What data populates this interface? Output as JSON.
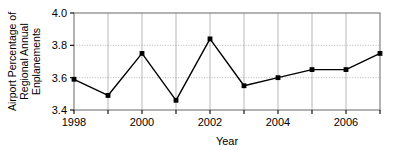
{
  "chart_data": {
    "type": "line",
    "title": "",
    "xlabel": "Year",
    "ylabel": "Airport Percentage of Regional Annual Enplanements",
    "ylabel_lines": [
      "Airport Percentage of",
      "Regional Annual",
      "Enplanements"
    ],
    "x": [
      1998,
      1999,
      2000,
      2001,
      2002,
      2003,
      2004,
      2005,
      2006,
      2007
    ],
    "values": [
      3.59,
      3.49,
      3.75,
      3.46,
      3.84,
      3.55,
      3.6,
      3.65,
      3.65,
      3.75
    ],
    "xlim": [
      1998,
      2007
    ],
    "ylim": [
      3.4,
      4.0
    ],
    "ytick_labels": [
      "4.0",
      "3.8",
      "3.6",
      "3.4"
    ],
    "ytick_values": [
      4.0,
      3.8,
      3.6,
      3.4
    ],
    "xtick_values": [
      1998,
      1999,
      2000,
      2001,
      2002,
      2003,
      2004,
      2005,
      2006,
      2007
    ],
    "xtick_labels": [
      "1998",
      "",
      "2000",
      "",
      "2002",
      "",
      "2004",
      "",
      "2006",
      ""
    ],
    "grid": true,
    "grid_style": "dotted",
    "legend": "none",
    "marker": "filled-square",
    "line_color": "#000000",
    "marker_color": "#000000",
    "grid_color": "#999999",
    "frame_color": "#808080",
    "background": "#ffffff"
  }
}
